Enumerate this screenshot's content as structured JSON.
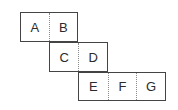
{
  "diagram": {
    "background_color": "#ffffff",
    "border_color": "#444444",
    "divider_color": "#8a8a8a",
    "label_color": "#2b2b2b",
    "rows": [
      {
        "id": "row-1",
        "cells": [
          {
            "label": "A"
          },
          {
            "label": "B"
          }
        ]
      },
      {
        "id": "row-2",
        "cells": [
          {
            "label": "C"
          },
          {
            "label": "D"
          }
        ]
      },
      {
        "id": "row-3",
        "cells": [
          {
            "label": "E"
          },
          {
            "label": "F"
          },
          {
            "label": "G"
          }
        ]
      }
    ]
  }
}
